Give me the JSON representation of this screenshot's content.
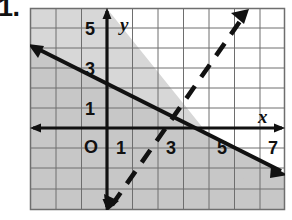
{
  "problem": {
    "number": "1."
  },
  "figure": {
    "name": "system-of-linear-inequalities-graph",
    "axis_labels": {
      "x": "x",
      "y": "y",
      "origin": "O"
    },
    "x_ticks": [
      {
        "value": 1,
        "label": "1"
      },
      {
        "value": 3,
        "label": "3"
      },
      {
        "value": 5,
        "label": "5"
      },
      {
        "value": 7,
        "label": "7"
      }
    ],
    "y_ticks": [
      {
        "value": 1,
        "label": "1"
      },
      {
        "value": 3,
        "label": "3"
      },
      {
        "value": 5,
        "label": "5"
      }
    ],
    "grid": {
      "x_min": -1,
      "x_max": 9,
      "y_min": -2,
      "y_max": 7,
      "cell_size": 1,
      "grid_color": "#6e6e6e",
      "axis_color": "#111111"
    },
    "colors": {
      "background": "#ffffff",
      "shade_light": "#c9c9c9",
      "shade_dark": "#a0a0a0",
      "line": "#111111"
    },
    "lines": [
      {
        "name": "solid-boundary-line",
        "style": "solid",
        "slope": -0.5,
        "y_intercept": 4,
        "arrows": "both",
        "shaded_side": "below"
      },
      {
        "name": "dashed-boundary-line",
        "style": "dashed",
        "slope": 1.5,
        "y_intercept": -3,
        "arrows": "both",
        "shaded_side": "above"
      }
    ],
    "intersection": {
      "x": 3.5,
      "y": 2.25
    }
  }
}
